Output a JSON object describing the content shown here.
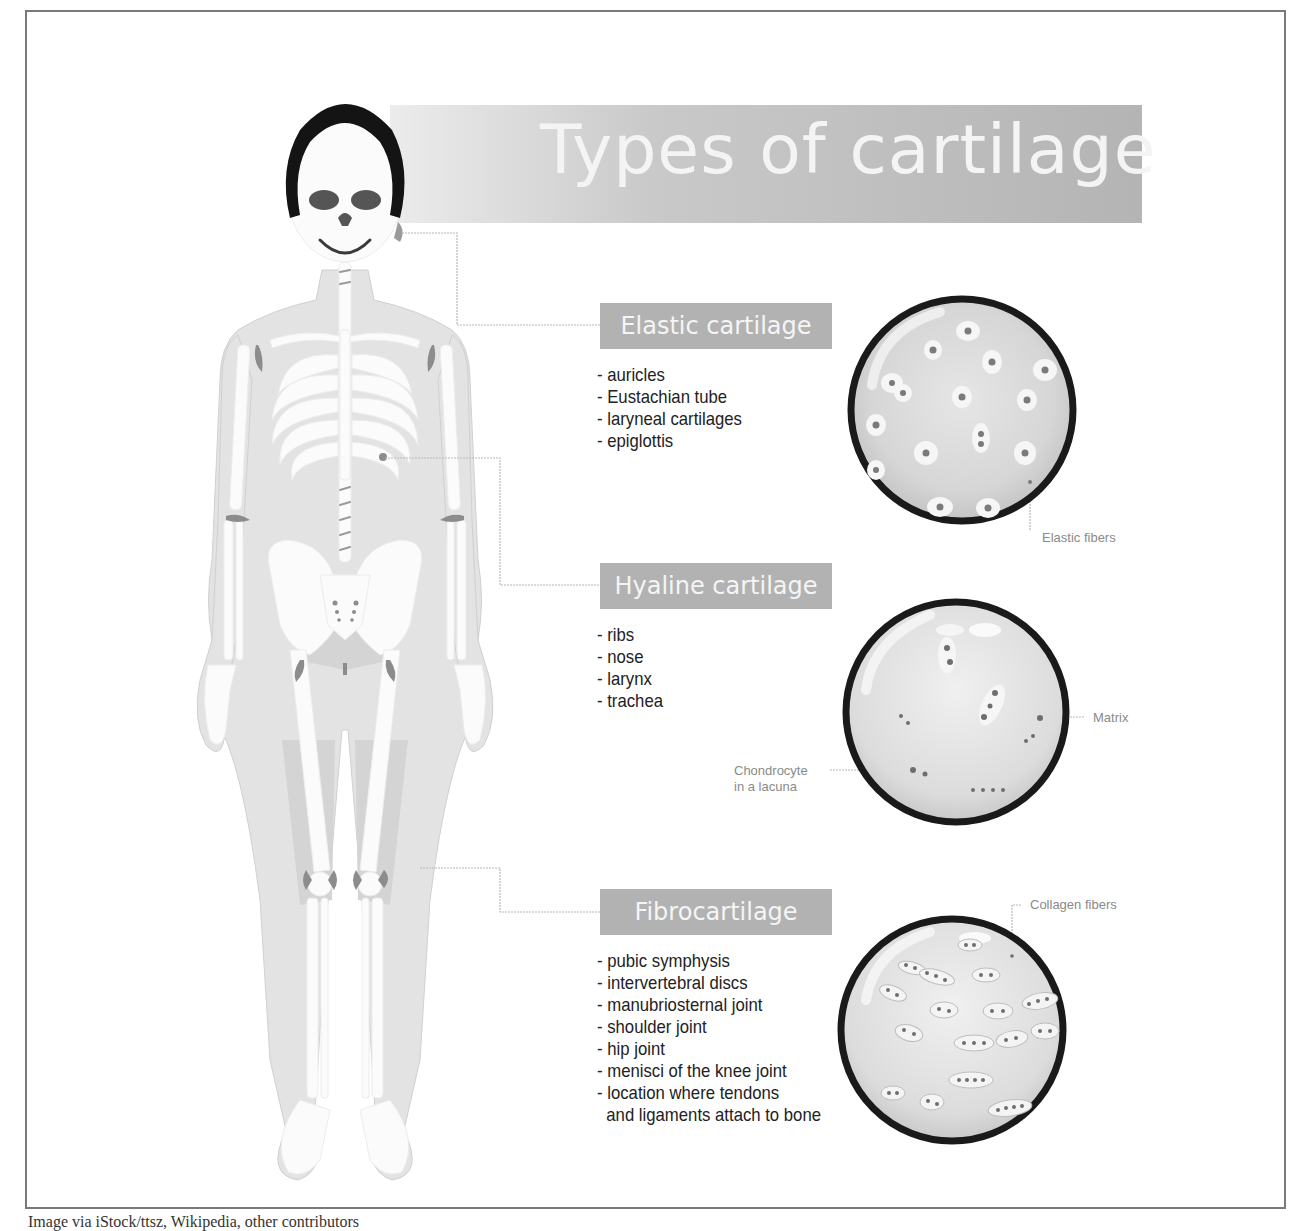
{
  "title": "Types of cartilage",
  "caption": "Image via iStock/ttsz, Wikipedia, other contributors",
  "colors": {
    "label_bg": "#b2b2b2",
    "label_text": "#f5f5f5",
    "title_gradient_start": "#ececec",
    "title_gradient_end": "#b4b4b4",
    "frame_border": "#7a7a7a",
    "circle_border": "#1a1a1a",
    "circle_fill": "#d9d9d9",
    "body_fill": "#e3e3e3",
    "bone_fill": "#fbfbfb",
    "cartilage_fill": "#8c8c8c",
    "list_text": "#222222",
    "annotation_text": "#8a8a8a"
  },
  "sections": [
    {
      "name": "Elastic cartilage",
      "items": [
        "- auricles",
        "- Eustachian tube",
        "- laryneal cartilages",
        "- epiglottis"
      ],
      "annotations": [
        "Elastic fibers"
      ]
    },
    {
      "name": "Hyaline cartilage",
      "items": [
        "- ribs",
        "- nose",
        "- larynx",
        "- trachea"
      ],
      "annotations": [
        "Matrix",
        "Chondrocyte",
        "in a lacuna"
      ]
    },
    {
      "name": "Fibrocartilage",
      "items": [
        "- pubic symphysis",
        "- intervertebral discs",
        "- manubriosternal joint",
        "- shoulder joint",
        "- hip joint",
        "- menisci of the knee joint",
        "- location where tendons",
        "  and ligaments attach to bone"
      ],
      "annotations": [
        "Collagen fibers"
      ]
    }
  ],
  "icons": {
    "skeleton": "skeleton-figure-icon",
    "elastic_micrograph": "elastic-cartilage-micrograph-icon",
    "hyaline_micrograph": "hyaline-cartilage-micrograph-icon",
    "fibro_micrograph": "fibrocartilage-micrograph-icon"
  }
}
